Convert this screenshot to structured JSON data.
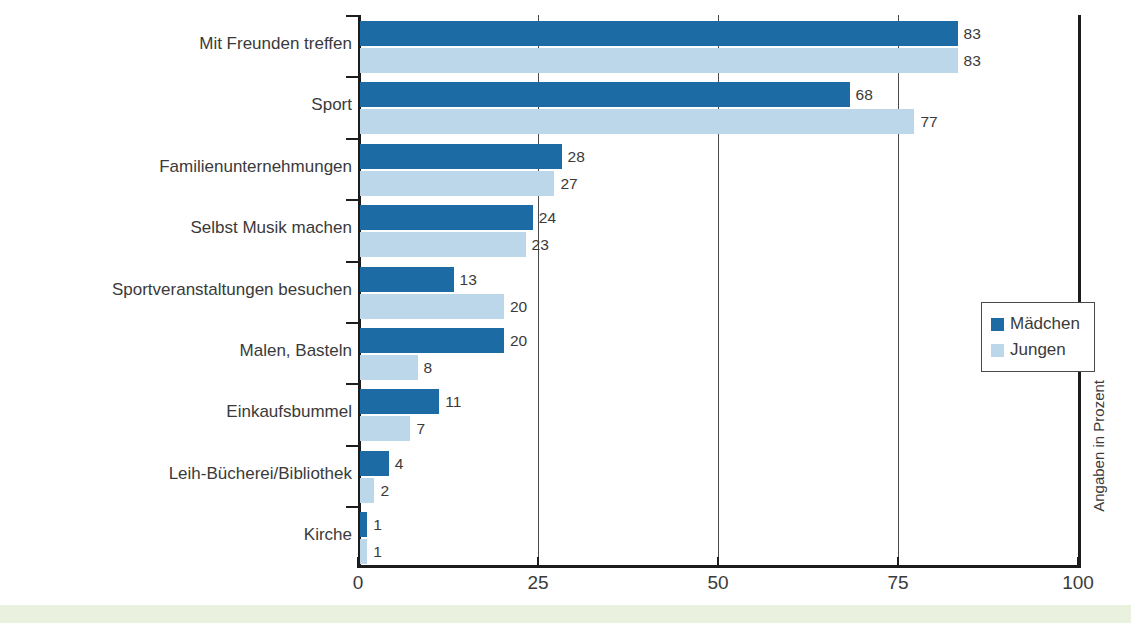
{
  "colors": {
    "series_girls": "#1d6ba4",
    "series_boys": "#bcd7ea",
    "axis": "#1c1c1c",
    "text": "#3a3a3a",
    "bottom_strip": "#eaf2df"
  },
  "legend": {
    "items": [
      {
        "label": "Mädchen",
        "color": "#1d6ba4"
      },
      {
        "label": "Jungen",
        "color": "#bcd7ea"
      }
    ]
  },
  "axis_note": "Angaben in Prozent",
  "chart_data": {
    "type": "bar",
    "orientation": "horizontal",
    "grouped": true,
    "title": "",
    "subtitle": "",
    "xlabel": "",
    "ylabel": "",
    "xlim": [
      0,
      100
    ],
    "xticks": [
      0,
      25,
      50,
      75,
      100
    ],
    "xtick_labels": [
      "0",
      "25",
      "50",
      "75",
      "100"
    ],
    "grid": true,
    "grid_axis": "x",
    "legend_position": "right-middle",
    "annotation": "Angaben in Prozent",
    "value_labels": true,
    "categories": [
      "Mit Freunden treffen",
      "Sport",
      "Familienunternehmungen",
      "Selbst Musik machen",
      "Sportveranstaltungen besuchen",
      "Malen, Basteln",
      "Einkaufsbummel",
      "Leih-Bücherei/Bibliothek",
      "Kirche"
    ],
    "series": [
      {
        "name": "Mädchen",
        "color": "#1d6ba4",
        "values": [
          83,
          68,
          28,
          24,
          13,
          20,
          11,
          4,
          1
        ]
      },
      {
        "name": "Jungen",
        "color": "#bcd7ea",
        "values": [
          83,
          77,
          27,
          23,
          20,
          8,
          7,
          2,
          1
        ]
      }
    ]
  }
}
